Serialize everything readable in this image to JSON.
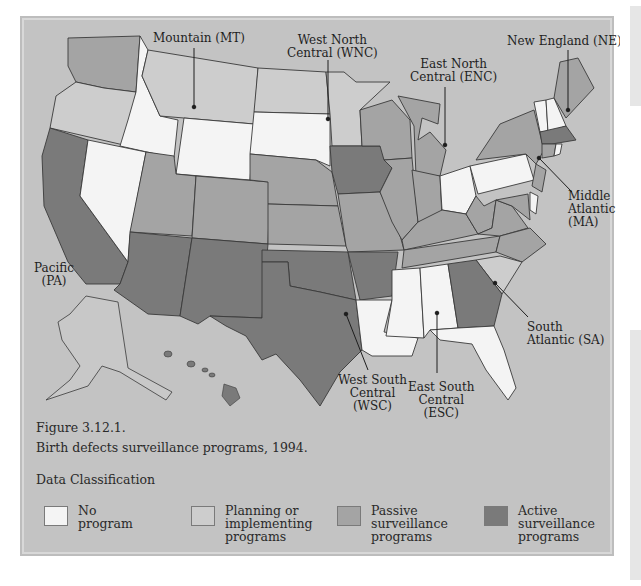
{
  "figure": {
    "number": "Figure 3.12.1.",
    "caption": "Birth defects surveillance programs, 1994."
  },
  "colors": {
    "background": "#c3c3c3",
    "no_program": "#f4f4f4",
    "planning": "#cdcdcd",
    "passive": "#a4a4a4",
    "active": "#7a7a7a",
    "border": "#3a3a3a"
  },
  "regions": {
    "mountain": "Mountain (MT)",
    "wnc_line1": "West North",
    "wnc_line2": "Central (WNC)",
    "enc_line1": "East North",
    "enc_line2": "Central (ENC)",
    "ne": "New England (NE)",
    "ma_line1": "Middle",
    "ma_line2": "Atlantic",
    "ma_line3": "(MA)",
    "pa_line1": "Pacific",
    "pa_line2": "(PA)",
    "sa_line1": "South",
    "sa_line2": "Atlantic (SA)",
    "wsc_line1": "West South",
    "wsc_line2": "Central",
    "wsc_line3": "(WSC)",
    "esc_line1": "East South",
    "esc_line2": "Central",
    "esc_line3": "(ESC)"
  },
  "legend": {
    "title": "Data Classification",
    "items": [
      {
        "line1": "No",
        "line2": "program",
        "line3": ""
      },
      {
        "line1": "Planning or",
        "line2": "implementing",
        "line3": "programs"
      },
      {
        "line1": "Passive",
        "line2": "surveillance",
        "line3": "programs"
      },
      {
        "line1": "Active",
        "line2": "surveillance",
        "line3": "programs"
      }
    ]
  },
  "states": {
    "no_program": [
      "ID",
      "NV",
      "WY",
      "SD",
      "OH",
      "PA",
      "LA",
      "MS",
      "AL",
      "FL",
      "VT",
      "NH"
    ],
    "planning": [
      "OR",
      "MT",
      "ND",
      "MN",
      "SC",
      "AK"
    ],
    "passive": [
      "WA",
      "UT",
      "CO",
      "NE",
      "KS",
      "MO",
      "WI",
      "MI",
      "IL",
      "IN",
      "KY",
      "TN",
      "WV",
      "VA",
      "NC",
      "MD",
      "NY",
      "NJ",
      "CT",
      "ME",
      "RI"
    ],
    "active": [
      "CA",
      "AZ",
      "NM",
      "TX",
      "OK",
      "AR",
      "IA",
      "GA",
      "MA",
      "HI"
    ]
  }
}
